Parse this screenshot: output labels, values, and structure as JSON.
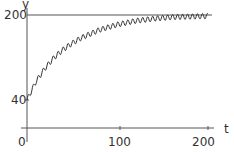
{
  "chart_data": {
    "type": "line",
    "title": "",
    "xlabel": "t",
    "ylabel": "y",
    "x_ticks": [
      "0",
      "100",
      "200"
    ],
    "y_ticks": [
      "40",
      "200"
    ],
    "xlim": [
      0,
      200
    ],
    "ylim": [
      0,
      210
    ],
    "grid": false,
    "legend": null,
    "reference_lines": [
      {
        "axis": "y",
        "value": 200
      }
    ],
    "series": [
      {
        "name": "y(t)",
        "description": "oscillating approach from 40 toward 200",
        "x": [
          0,
          10,
          20,
          30,
          40,
          50,
          60,
          80,
          100,
          120,
          140,
          160,
          180,
          200
        ],
        "values": [
          40,
          75,
          100,
          120,
          135,
          147,
          157,
          172,
          182,
          189,
          193,
          196,
          197,
          198
        ],
        "oscillation_amplitude": 5
      }
    ]
  }
}
